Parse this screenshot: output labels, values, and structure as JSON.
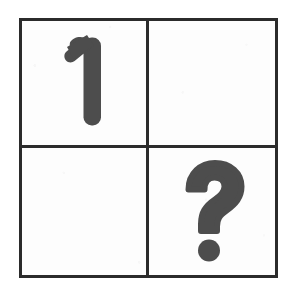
{
  "figure": {
    "type": "matrix-grid",
    "rows": 2,
    "columns": 2,
    "background_color": "#ffffff",
    "border_color": "#2b2b2b",
    "ink_color": "#4d4d4d",
    "border_width_px": 3,
    "grid_box": {
      "x": 19,
      "y": 18,
      "width": 259,
      "height": 260
    }
  },
  "cells": [
    {
      "id": "cell-r0c0",
      "row": 0,
      "column": 0,
      "position_label": "top-left",
      "content": "1",
      "content_type": "digit",
      "empty": false
    },
    {
      "id": "cell-r0c1",
      "row": 0,
      "column": 1,
      "position_label": "top-right",
      "content": "",
      "content_type": "blank",
      "empty": true
    },
    {
      "id": "cell-r1c0",
      "row": 1,
      "column": 0,
      "position_label": "bottom-left",
      "content": "",
      "content_type": "blank",
      "empty": true
    },
    {
      "id": "cell-r1c1",
      "row": 1,
      "column": 1,
      "position_label": "bottom-right",
      "content": "?",
      "content_type": "question-mark",
      "empty": false
    }
  ]
}
